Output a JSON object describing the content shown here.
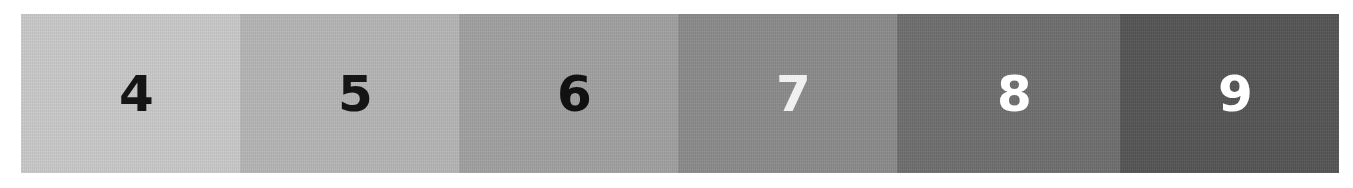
{
  "scale": {
    "swatches": [
      {
        "label": "4",
        "fill": "#c9c9c9",
        "text_color": "#151515",
        "width": 219
      },
      {
        "label": "5",
        "fill": "#b5b5b5",
        "text_color": "#151515",
        "width": 219
      },
      {
        "label": "6",
        "fill": "#a1a1a1",
        "text_color": "#111111",
        "width": 219
      },
      {
        "label": "7",
        "fill": "#8b8b8b",
        "text_color": "#f0f0f0",
        "width": 219
      },
      {
        "label": "8",
        "fill": "#6f6f6f",
        "text_color": "#ffffff",
        "width": 223
      },
      {
        "label": "9",
        "fill": "#555555",
        "text_color": "#ffffff",
        "width": 219
      }
    ]
  }
}
